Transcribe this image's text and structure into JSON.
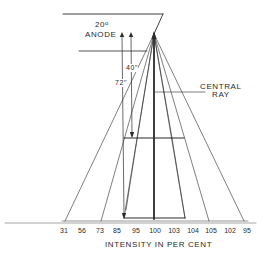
{
  "diagram": {
    "type": "x-ray beam intensity distribution (heel effect)",
    "labels": {
      "anode_angle": "20",
      "anode_angle_unit": "o",
      "anode": "ANODE",
      "distance_short": "40\"",
      "distance_long": "72\"",
      "central_ray_line1": "CENTRAL",
      "central_ray_line2": "RAY",
      "axis_title": "INTENSITY IN PER CENT"
    },
    "intensity_ticks": [
      {
        "label": "31",
        "x": 64
      },
      {
        "label": "56",
        "x": 82
      },
      {
        "label": "73",
        "x": 100
      },
      {
        "label": "85",
        "x": 117
      },
      {
        "label": "95",
        "x": 136
      },
      {
        "label": "100",
        "x": 154
      },
      {
        "label": "103",
        "x": 172
      },
      {
        "label": "104",
        "x": 192
      },
      {
        "label": "105",
        "x": 210
      },
      {
        "label": "102",
        "x": 229
      },
      {
        "label": "95",
        "x": 246
      }
    ],
    "colors": {
      "ink": "#2a2a2a",
      "background": "#ffffff"
    }
  }
}
